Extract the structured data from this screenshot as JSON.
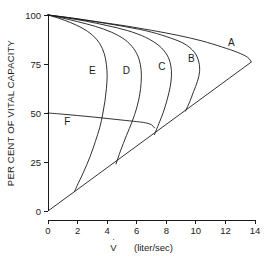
{
  "chart_data": {
    "type": "line",
    "title": "",
    "subtitle": "",
    "xlabel": "V̇  (liter/sec)",
    "xlabel_symbol": "V",
    "xlabel_units": "(liter/sec)",
    "ylabel": "PER CENT OF VITAL CAPACITY",
    "xlim": [
      0,
      14
    ],
    "ylim": [
      0,
      100
    ],
    "xticks": [
      0,
      2,
      4,
      6,
      8,
      10,
      12,
      14
    ],
    "xtick_labels": [
      "0",
      "2",
      "4",
      "6",
      "8",
      "10",
      "12",
      "14"
    ],
    "yticks": [
      0,
      25,
      50,
      75,
      100
    ],
    "ytick_labels": [
      "0",
      "25",
      "50",
      "75",
      "100"
    ],
    "grid": false,
    "legend": "none",
    "annotations": [
      {
        "text": "A",
        "x": 12.4,
        "y": 84
      },
      {
        "text": "B",
        "x": 9.7,
        "y": 76
      },
      {
        "text": "C",
        "x": 7.7,
        "y": 72
      },
      {
        "text": "D",
        "x": 5.3,
        "y": 70
      },
      {
        "text": "E",
        "x": 3.0,
        "y": 70
      },
      {
        "text": "F",
        "x": 1.3,
        "y": 44
      }
    ],
    "series": [
      {
        "name": "A",
        "label": "A",
        "description": "maximal effort expiratory flow-volume curve",
        "points": [
          [
            0.0,
            100
          ],
          [
            1.6,
            98.5
          ],
          [
            3.4,
            96.5
          ],
          [
            5.2,
            94.5
          ],
          [
            7.0,
            92.2
          ],
          [
            8.8,
            89.6
          ],
          [
            10.4,
            86.8
          ],
          [
            11.8,
            83.6
          ],
          [
            12.8,
            81.0
          ],
          [
            13.5,
            78.4
          ],
          [
            13.75,
            76.0
          ]
        ]
      },
      {
        "name": "B",
        "label": "B",
        "description": "submaximal effort curve B",
        "points": [
          [
            0.0,
            100
          ],
          [
            1.4,
            98.6
          ],
          [
            3.0,
            96.8
          ],
          [
            4.8,
            94.6
          ],
          [
            6.6,
            92.0
          ],
          [
            8.0,
            89.0
          ],
          [
            9.2,
            85.4
          ],
          [
            9.9,
            81.0
          ],
          [
            10.2,
            76.0
          ],
          [
            10.25,
            71.0
          ],
          [
            10.1,
            66.0
          ],
          [
            9.85,
            61.0
          ],
          [
            9.6,
            56.0
          ],
          [
            9.3,
            51.0
          ]
        ]
      },
      {
        "name": "C",
        "label": "C",
        "description": "submaximal effort curve C",
        "points": [
          [
            0.0,
            100
          ],
          [
            1.2,
            98.6
          ],
          [
            2.6,
            96.8
          ],
          [
            4.0,
            94.6
          ],
          [
            5.4,
            92.0
          ],
          [
            6.6,
            88.6
          ],
          [
            7.5,
            84.4
          ],
          [
            8.05,
            79.6
          ],
          [
            8.3,
            74.4
          ],
          [
            8.35,
            68.8
          ],
          [
            8.25,
            62.8
          ],
          [
            8.05,
            56.6
          ],
          [
            7.8,
            50.4
          ],
          [
            7.5,
            44.6
          ],
          [
            7.2,
            39.0
          ]
        ]
      },
      {
        "name": "D",
        "label": "D",
        "description": "submaximal effort curve D",
        "points": [
          [
            0.0,
            100
          ],
          [
            0.9,
            98.6
          ],
          [
            2.0,
            96.6
          ],
          [
            3.2,
            94.2
          ],
          [
            4.3,
            91.2
          ],
          [
            5.2,
            87.4
          ],
          [
            5.8,
            82.8
          ],
          [
            6.15,
            77.6
          ],
          [
            6.3,
            71.8
          ],
          [
            6.3,
            65.6
          ],
          [
            6.2,
            59.2
          ],
          [
            6.0,
            52.6
          ],
          [
            5.7,
            45.8
          ],
          [
            5.3,
            38.4
          ],
          [
            4.9,
            30.6
          ],
          [
            4.6,
            24.0
          ]
        ]
      },
      {
        "name": "E",
        "label": "E",
        "description": "low effort curve E",
        "points": [
          [
            0.0,
            100
          ],
          [
            0.7,
            98.4
          ],
          [
            1.5,
            96.2
          ],
          [
            2.3,
            93.4
          ],
          [
            3.0,
            89.8
          ],
          [
            3.5,
            85.4
          ],
          [
            3.8,
            80.4
          ],
          [
            3.95,
            74.8
          ],
          [
            4.0,
            68.8
          ],
          [
            3.95,
            62.4
          ],
          [
            3.85,
            56.0
          ],
          [
            3.7,
            49.4
          ],
          [
            3.5,
            42.6
          ],
          [
            3.2,
            35.4
          ],
          [
            2.85,
            27.8
          ],
          [
            2.4,
            19.8
          ],
          [
            1.95,
            12.6
          ],
          [
            1.8,
            10.0
          ]
        ]
      },
      {
        "name": "F",
        "label": "F",
        "description": "low lung volume effort-independent envelope",
        "points": [
          [
            0.0,
            50.0
          ],
          [
            1.0,
            49.4
          ],
          [
            2.0,
            48.7
          ],
          [
            3.0,
            48.0
          ],
          [
            4.0,
            47.2
          ],
          [
            5.0,
            46.4
          ],
          [
            6.0,
            45.6
          ],
          [
            6.6,
            45.0
          ],
          [
            7.0,
            44.0
          ],
          [
            7.2,
            42.4
          ]
        ]
      },
      {
        "name": "effort-line",
        "label": "",
        "description": "line of maximal flow peaks connecting origin to peak of curve A",
        "points": [
          [
            0.0,
            0
          ],
          [
            13.75,
            76.0
          ]
        ]
      }
    ]
  }
}
